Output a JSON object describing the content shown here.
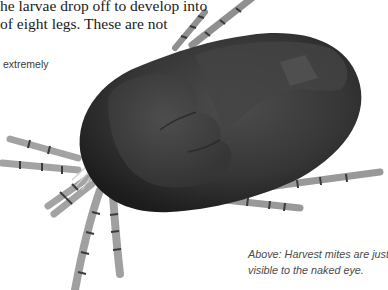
{
  "body_text": {
    "lines": [
      "he larvae drop off to develop into",
      "of eight legs. These are not"
    ]
  },
  "side_text": "extremely",
  "illustration": {
    "subject": "harvest mite",
    "colors": {
      "body": "#2e2e2e",
      "body_highlight": "#4a4a4a",
      "legs": "#9a9a9a",
      "leg_joints": "#3a3a3a"
    }
  },
  "caption": {
    "lines": [
      "Above: Harvest mites are just",
      "visible to the naked eye."
    ]
  }
}
